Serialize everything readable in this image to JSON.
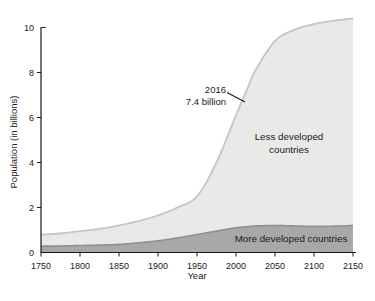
{
  "colors": {
    "background": "#ffffff",
    "axis": "#1a1a1a",
    "text": "#1a1a1a"
  },
  "labels": {
    "less_developed_line1": "Less developed",
    "less_developed_line2": "countries",
    "more_developed": "More developed countries"
  },
  "chart_data": {
    "type": "area",
    "stacked": true,
    "title": "",
    "xlabel": "Year",
    "ylabel": "Population (in billions)",
    "xlim": [
      1750,
      2150
    ],
    "ylim": [
      0,
      10
    ],
    "x_ticks": [
      1750,
      1800,
      1850,
      1900,
      1950,
      2000,
      2050,
      2100,
      2150
    ],
    "y_ticks": [
      0,
      2,
      4,
      6,
      8,
      10
    ],
    "grid": false,
    "legend_position": "inline-labels",
    "x": [
      1750,
      1775,
      1800,
      1825,
      1850,
      1875,
      1900,
      1925,
      1950,
      1975,
      2000,
      2016,
      2025,
      2050,
      2075,
      2100,
      2125,
      2150
    ],
    "series": [
      {
        "name": "More developed countries",
        "fill": "#a8a9a7",
        "edge": "#8f908e",
        "values": [
          0.28,
          0.29,
          0.31,
          0.33,
          0.36,
          0.43,
          0.52,
          0.65,
          0.8,
          0.95,
          1.1,
          1.15,
          1.18,
          1.2,
          1.18,
          1.16,
          1.17,
          1.2
        ]
      },
      {
        "name": "Less developed countries",
        "fill": "#e9e9e7",
        "edge": "#c5c5c3",
        "values": [
          0.51,
          0.56,
          0.64,
          0.72,
          0.84,
          0.97,
          1.13,
          1.35,
          1.7,
          3.05,
          5.0,
          6.25,
          6.92,
          8.2,
          8.72,
          8.99,
          9.13,
          9.2
        ]
      }
    ],
    "annotation": {
      "lines": [
        "2016",
        "7.4 billion"
      ],
      "points_to": {
        "year": 2016,
        "total_billions": 7.4
      }
    }
  }
}
